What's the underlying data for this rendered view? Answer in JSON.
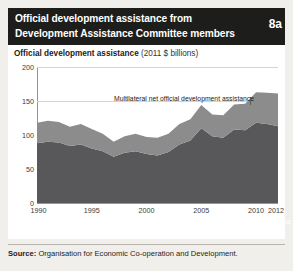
{
  "header": {
    "title_line1": "Official development assistance from",
    "title_line2": "Development Assistance Committee members",
    "badge": "8a"
  },
  "chart_subtitle_bold": "Official development assistance",
  "chart_subtitle_units": "(2011 $ billions)",
  "source": {
    "label": "Source:",
    "text": " Organisation for Economic Co-operation and Development."
  },
  "colors": {
    "header_bg": "#1d1d1b",
    "page_bg": "#f1efeb",
    "card_bg": "#ffffff",
    "bilateral": "#58585a",
    "multilateral": "#8c8c8c",
    "gridline": "#d7d4cf",
    "axis": "#9a968f"
  },
  "chart_data": {
    "type": "area",
    "stacked": true,
    "title": "Official development assistance",
    "subtitle": "(2011 $ billions)",
    "xlabel": "",
    "ylabel": "2011 $ billions",
    "xlim": [
      1990,
      2012
    ],
    "ylim": [
      0,
      200
    ],
    "yticks": [
      0,
      50,
      100,
      150,
      200
    ],
    "ytick_labels": [
      "0",
      "50",
      "100",
      "150",
      "200"
    ],
    "xticks": [
      1990,
      1995,
      2000,
      2005,
      2010,
      2012
    ],
    "xtick_labels": [
      "1990",
      "1995",
      "2000",
      "2005",
      "2010",
      "2012"
    ],
    "grid": true,
    "legend_position": "inline-annotation",
    "x": [
      1990,
      1991,
      1992,
      1993,
      1994,
      1995,
      1996,
      1997,
      1998,
      1999,
      2000,
      2001,
      2002,
      2003,
      2004,
      2005,
      2006,
      2007,
      2008,
      2009,
      2010,
      2011,
      2012
    ],
    "series": [
      {
        "name": "Bilateral net official development assistance",
        "color": "#58585a",
        "values": [
          88,
          90,
          89,
          84,
          86,
          80,
          76,
          68,
          74,
          76,
          72,
          70,
          75,
          86,
          92,
          110,
          98,
          96,
          108,
          107,
          118,
          116,
          113
        ]
      },
      {
        "name": "Multilateral net official development assistance",
        "color": "#8c8c8c",
        "values": [
          30,
          31,
          30,
          28,
          30,
          29,
          26,
          22,
          24,
          26,
          25,
          26,
          27,
          30,
          31,
          34,
          32,
          33,
          37,
          39,
          45,
          46,
          48
        ]
      }
    ],
    "totals": [
      118,
      121,
      119,
      112,
      116,
      109,
      102,
      90,
      98,
      102,
      97,
      96,
      102,
      116,
      123,
      144,
      130,
      129,
      145,
      146,
      163,
      162,
      161
    ],
    "annotations": [
      {
        "text": "Multilateral net official development assistance",
        "series": "multilateral"
      },
      {
        "text": "Bilateral net official development assistance",
        "series": "bilateral"
      }
    ]
  }
}
